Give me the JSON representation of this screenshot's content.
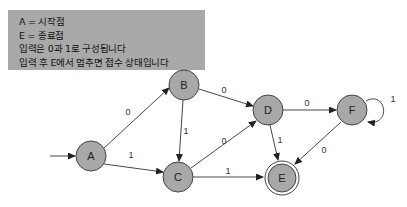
{
  "notes": [
    "A = 시작점",
    "E = 종료점",
    "입력은 0과 1로 구성됩니다",
    "입력 후 E에서 멈추면 접수 상태입니다"
  ],
  "diagram": {
    "type": "finite-state-automaton",
    "start_state": "A",
    "accept_states": [
      "E"
    ],
    "nodes": {
      "A": {
        "label": "A",
        "x": 91,
        "y": 156
      },
      "B": {
        "label": "B",
        "x": 184,
        "y": 85
      },
      "C": {
        "label": "C",
        "x": 178,
        "y": 177
      },
      "D": {
        "label": "D",
        "x": 268,
        "y": 110
      },
      "E": {
        "label": "E",
        "x": 282,
        "y": 178
      },
      "F": {
        "label": "F",
        "x": 352,
        "y": 110
      }
    },
    "edges": [
      {
        "from": "A",
        "to": "B",
        "label": "0"
      },
      {
        "from": "A",
        "to": "C",
        "label": "1"
      },
      {
        "from": "B",
        "to": "D",
        "label": "0"
      },
      {
        "from": "B",
        "to": "C",
        "label": "1"
      },
      {
        "from": "C",
        "to": "D",
        "label": "0"
      },
      {
        "from": "C",
        "to": "E",
        "label": "1"
      },
      {
        "from": "D",
        "to": "F",
        "label": "0"
      },
      {
        "from": "D",
        "to": "E",
        "label": "1"
      },
      {
        "from": "F",
        "to": "E",
        "label": "0"
      },
      {
        "from": "F",
        "to": "F",
        "label": "1"
      }
    ]
  }
}
